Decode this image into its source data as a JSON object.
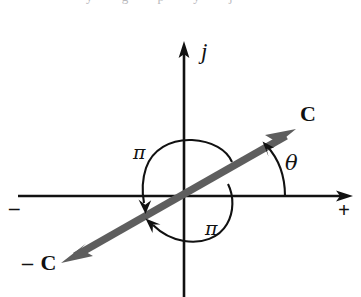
{
  "figure": {
    "title": "",
    "caption_fragment": "y g p y j",
    "background_color": "#ffffff",
    "axis_color": "#111111",
    "vector_color": "#5e5e5e",
    "arc_color": "#111111",
    "width": 361,
    "height": 297,
    "origin": {
      "x": 184,
      "y": 196
    }
  },
  "axes": {
    "vertical": {
      "name": "imaginary-axis",
      "label": "j",
      "x": 184,
      "top_y": 43,
      "bottom_y": 297,
      "arrow_at": "top"
    },
    "horizontal": {
      "name": "real-axis",
      "y": 196,
      "left_x": 18,
      "right_x": 352,
      "arrow_at": "right",
      "negative_label": "–",
      "positive_label": "+"
    }
  },
  "vectors": [
    {
      "name": "vector-c",
      "label": "C",
      "from": {
        "x": 184,
        "y": 196
      },
      "to": {
        "x": 295,
        "y": 130
      },
      "label_at": {
        "x": 300,
        "y": 103
      },
      "arrowhead": true
    },
    {
      "name": "vector-minus-c",
      "label": "– C",
      "from": {
        "x": 184,
        "y": 196
      },
      "to": {
        "x": 62,
        "y": 262
      },
      "label_at": {
        "x": 22,
        "y": 252
      },
      "arrowhead": true
    }
  ],
  "angles": [
    {
      "name": "angle-theta",
      "label": "θ",
      "from_axis": "positive-real-axis",
      "to_vector": "vector-c",
      "direction": "counterclockwise",
      "label_at": {
        "x": 285,
        "y": 153
      }
    },
    {
      "name": "angle-pi-upper",
      "label": "π",
      "direction": "counterclockwise",
      "description": "arc from vector C rotating through upper half plane to vector -C",
      "label_at": {
        "x": 133,
        "y": 143
      }
    },
    {
      "name": "angle-pi-lower",
      "label": "π",
      "direction": "counterclockwise",
      "description": "arc from vector -C rotating through lower half plane to vector C",
      "label_at": {
        "x": 205,
        "y": 219
      }
    }
  ]
}
